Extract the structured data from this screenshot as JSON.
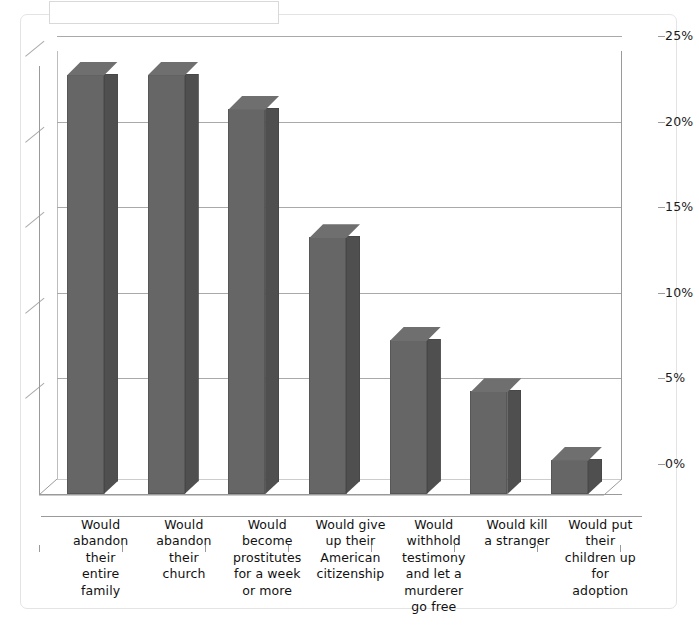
{
  "title_box": {
    "text": ""
  },
  "axis": {
    "y_ticks": [
      "0%",
      "5%",
      "10%",
      "15%",
      "20%",
      "25%"
    ],
    "y_min": 0,
    "y_max": 25,
    "y_step": 5
  },
  "chart_data": {
    "type": "bar",
    "title": "",
    "subtitle": "",
    "xlabel": "",
    "ylabel": "",
    "ylim": [
      0,
      25
    ],
    "ytick_labels": [
      "0%",
      "5%",
      "10%",
      "15%",
      "20%",
      "25%"
    ],
    "grid": true,
    "legend": "none",
    "style": "3d-column",
    "bar_color": "#666666",
    "bar_side_color": "#4f4f4f",
    "bar_top_color": "#6f6f6f",
    "categories": [
      "Would abandon their entire family",
      "Would abandon their church",
      "Would become prostitutes for a week or more",
      "Would give up their American citizenship",
      "Would withhold testimony and let a murderer go free",
      "Would kill a stranger",
      "Would put their children up for adoption"
    ],
    "category_lines": [
      [
        "Would",
        "abandon",
        "their",
        "entire",
        "family"
      ],
      [
        "Would",
        "abandon",
        "their",
        "church"
      ],
      [
        "Would",
        "become",
        "prostitutes",
        "for a week",
        "or more"
      ],
      [
        "Would give",
        "up their",
        "American",
        "citizenship"
      ],
      [
        "Would",
        "withhold",
        "testimony",
        "and let a",
        "murderer",
        "go free"
      ],
      [
        "Would kill",
        "a stranger"
      ],
      [
        "Would put",
        "their",
        "children up",
        "for",
        "adoption"
      ]
    ],
    "values": [
      24.5,
      24.5,
      22.5,
      15.0,
      9.0,
      6.0,
      2.0
    ],
    "value_labels": [
      "24.5%",
      "24.5%",
      "22.5%",
      "15%",
      "9%",
      "6%",
      "2%"
    ]
  }
}
